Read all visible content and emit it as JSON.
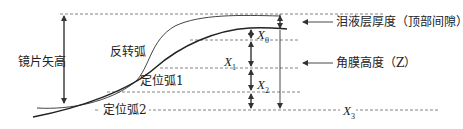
{
  "diagram": {
    "labels": {
      "lens_sag": "镜片矢高",
      "reverse_curve": "反转弧",
      "alignment_curve_1": "定位弧1",
      "alignment_curve_2": "定位弧2",
      "tear_layer": "泪液层厚度（顶部间隙）",
      "corneal_height": "角膜高度（Z）"
    },
    "variables": {
      "x0": {
        "base": "X",
        "sub": "0"
      },
      "x1": {
        "base": "X",
        "sub": "1"
      },
      "x2": {
        "base": "X",
        "sub": "2"
      },
      "x3": {
        "base": "X",
        "sub": "3"
      }
    },
    "colors": {
      "line": "#333333",
      "dashed": "#777777",
      "text": "#222222"
    }
  }
}
